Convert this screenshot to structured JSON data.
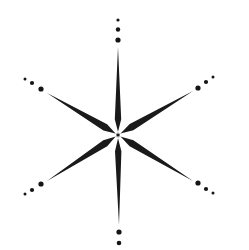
{
  "diagram": {
    "type": "six-pointed-star",
    "background": "#ffffff",
    "ray_color": "#1a1a1a",
    "dot_color": "#151515",
    "center": [
      118,
      135
    ],
    "rays": [
      {
        "name": "top",
        "tip": [
          118,
          47
        ],
        "half_width": 3.2
      },
      {
        "name": "bottom",
        "tip": [
          119,
          225
        ],
        "half_width": 3.2
      },
      {
        "name": "upper-left",
        "tip": [
          47,
          93
        ],
        "half_width": 3.6
      },
      {
        "name": "upper-right",
        "tip": [
          193,
          91
        ],
        "half_width": 3.6
      },
      {
        "name": "lower-left",
        "tip": [
          47,
          181
        ],
        "half_width": 3.6
      },
      {
        "name": "lower-right",
        "tip": [
          193,
          181
        ],
        "half_width": 3.6
      }
    ],
    "dot_groups": [
      {
        "name": "top",
        "dots": [
          [
            118,
            40,
            2.6
          ],
          [
            118,
            29.5,
            2.2
          ],
          [
            118,
            20,
            1.6
          ]
        ]
      },
      {
        "name": "bottom",
        "dots": [
          [
            119,
            232,
            2.6
          ],
          [
            119,
            243,
            2.3
          ]
        ]
      },
      {
        "name": "upper-left",
        "dots": [
          [
            41,
            89,
            2.6
          ],
          [
            32,
            83,
            2.1
          ],
          [
            25,
            79,
            1.5
          ]
        ]
      },
      {
        "name": "upper-right",
        "dots": [
          [
            198,
            88,
            2.6
          ],
          [
            206,
            82,
            2.1
          ],
          [
            213,
            77,
            1.5
          ]
        ]
      },
      {
        "name": "lower-left",
        "dots": [
          [
            41,
            184,
            2.6
          ],
          [
            32,
            190,
            2.1
          ],
          [
            25,
            194,
            1.5
          ]
        ]
      },
      {
        "name": "lower-right",
        "dots": [
          [
            198,
            183,
            2.6
          ],
          [
            206,
            189,
            2.1
          ],
          [
            213,
            193,
            1.5
          ]
        ]
      }
    ]
  }
}
